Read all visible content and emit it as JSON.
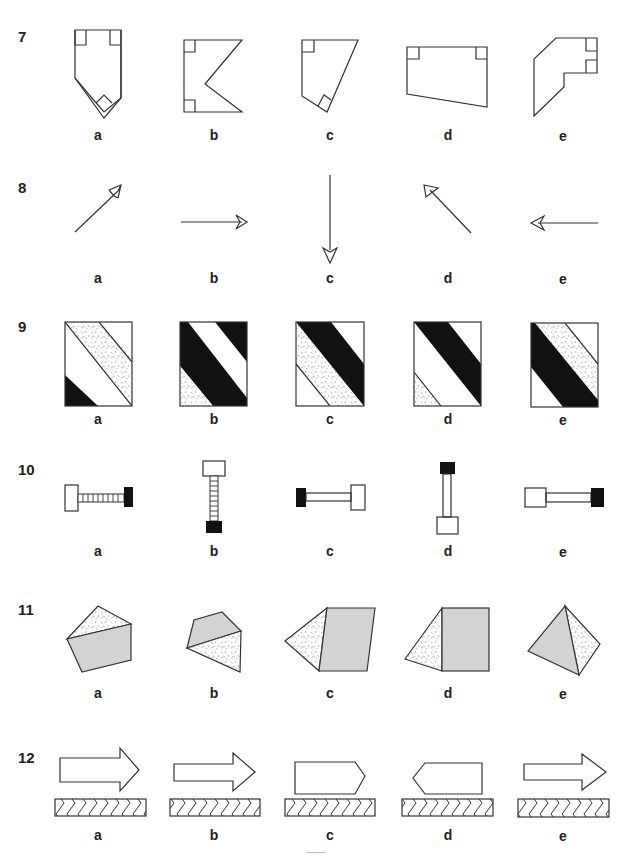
{
  "questions": [
    {
      "number": "7",
      "options": [
        "a",
        "b",
        "c",
        "d",
        "e"
      ],
      "figure_type": "polygons-with-right-angle-marks"
    },
    {
      "number": "8",
      "options": [
        "a",
        "b",
        "c",
        "d",
        "e"
      ],
      "figure_type": "arrows-various-directions"
    },
    {
      "number": "9",
      "options": [
        "a",
        "b",
        "c",
        "d",
        "e"
      ],
      "figure_type": "squares-with-diagonal-bands"
    },
    {
      "number": "10",
      "options": [
        "a",
        "b",
        "c",
        "d",
        "e"
      ],
      "figure_type": "dumbbell-shapes"
    },
    {
      "number": "11",
      "options": [
        "a",
        "b",
        "c",
        "d",
        "e"
      ],
      "figure_type": "shaded-polygons"
    },
    {
      "number": "12",
      "options": [
        "a",
        "b",
        "c",
        "d",
        "e"
      ],
      "figure_type": "arrows-over-chevron-bars"
    }
  ],
  "colors": {
    "line": "#333333",
    "shade": "#d3d3d3",
    "black": "#111111",
    "background": "#ffffff"
  }
}
